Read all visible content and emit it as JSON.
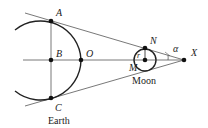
{
  "diagram": {
    "colors": {
      "stroke": "#222222",
      "thin": "#555555",
      "background": "#ffffff"
    },
    "points": [
      {
        "id": "A",
        "label": "A",
        "x": 51,
        "y": 21
      },
      {
        "id": "B",
        "label": "B",
        "x": 51,
        "y": 60
      },
      {
        "id": "C",
        "label": "C",
        "x": 51,
        "y": 98
      },
      {
        "id": "O",
        "label": "O",
        "x": 81,
        "y": 60
      },
      {
        "id": "N",
        "label": "N",
        "x": 145,
        "y": 48
      },
      {
        "id": "M",
        "label": "M",
        "x": 145,
        "y": 60
      },
      {
        "id": "X",
        "label": "X",
        "x": 184,
        "y": 60
      }
    ],
    "labels": {
      "A": "A",
      "B": "B",
      "C": "C",
      "O": "O",
      "N": "N",
      "M": "M",
      "X": "X",
      "r": "r",
      "alpha": "α",
      "earth": "Earth",
      "moon": "Moon"
    }
  }
}
